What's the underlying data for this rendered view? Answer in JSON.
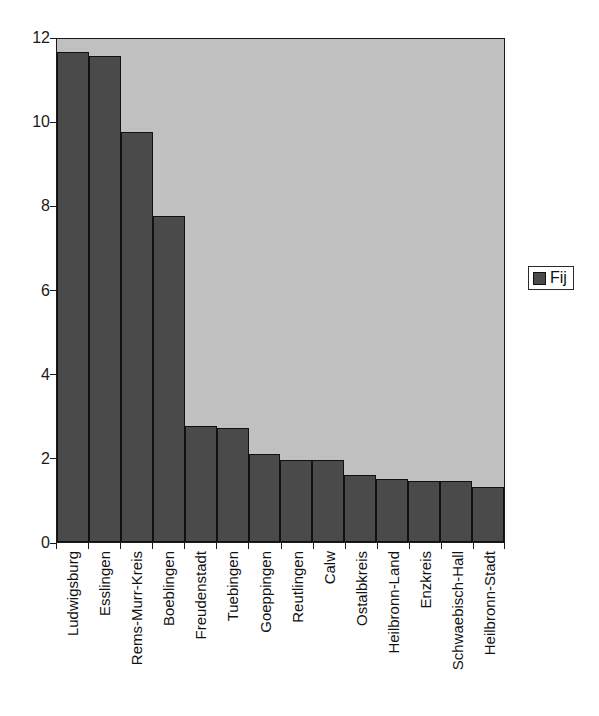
{
  "chart_data": {
    "type": "bar",
    "title": "",
    "subtitle": "",
    "xlabel": "",
    "ylabel": "",
    "ylim": [
      0,
      12
    ],
    "yticks": [
      0,
      2,
      4,
      6,
      8,
      10,
      12
    ],
    "ytick_labels": [
      "0",
      "2",
      "4",
      "6",
      "8",
      "10",
      "12"
    ],
    "grid": false,
    "legend": {
      "position": "right",
      "entries": [
        {
          "label": "Fij",
          "color": "#4a4a4a"
        }
      ]
    },
    "categories": [
      "Ludwigsburg",
      "Esslingen",
      "Rems-Murr-Kreis",
      "Boeblingen",
      "Freudenstadt",
      "Tuebingen",
      "Goeppingen",
      "Reutlingen",
      "Calw",
      "Ostalbkreis",
      "Heilbronn-Land",
      "Enzkreis",
      "Schwaebisch-Hall",
      "Heilbronn-Stadt"
    ],
    "series": [
      {
        "name": "Fij",
        "color": "#4a4a4a",
        "values": [
          11.65,
          11.55,
          9.75,
          7.75,
          2.75,
          2.7,
          2.1,
          1.95,
          1.95,
          1.6,
          1.5,
          1.45,
          1.45,
          1.3
        ]
      }
    ]
  },
  "style": {
    "plot_background": "#c0c0c0",
    "bar_color": "#4a4a4a",
    "axis_color": "#1a1a1a",
    "page_background": "#ffffff"
  }
}
